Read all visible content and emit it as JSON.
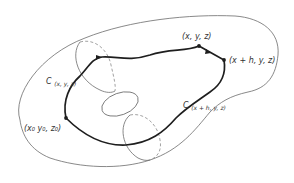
{
  "diagram": {
    "title": "",
    "colors": {
      "background": "#ffffff",
      "outline": "#6b6b6b",
      "hidden_edge": "#8a8a8a",
      "path": "#1e1e1e",
      "text": "#333333"
    },
    "labels": {
      "start_point": "(x₀ y₀, z₀)",
      "point_xyz": "(x, y, z)",
      "point_xhyz": "(x + h, y, z)",
      "curve_1_main": "C",
      "curve_1_sub": "(x, y, z)",
      "curve_2_main": "C",
      "curve_2_sub": "(x + h, y, z)"
    },
    "elements": {
      "outer_surface": "closed irregular surface outline",
      "cross_sections": [
        "upper-left elliptical section (partly dashed)",
        "inner hole ellipse",
        "lower elliptical section (partly dashed)"
      ],
      "path": "thick closed curve through (x0,y0,z0), (x,y,z), (x+h,y,z) with direction arrows"
    }
  }
}
